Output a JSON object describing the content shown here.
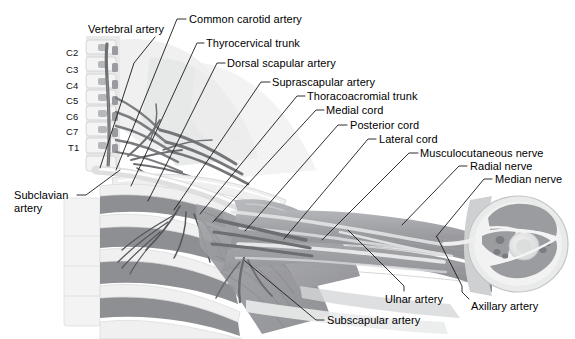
{
  "figure": {
    "background_color": "#ffffff",
    "line_color": "#1a1a1a",
    "text_color": "#000000"
  },
  "vertebrae": [
    {
      "id": "c2",
      "label": "C2",
      "x": 66,
      "y": 53
    },
    {
      "id": "c3",
      "label": "C3",
      "x": 66,
      "y": 70
    },
    {
      "id": "c4",
      "label": "C4",
      "x": 66,
      "y": 86
    },
    {
      "id": "c5",
      "label": "C5",
      "x": 66,
      "y": 101
    },
    {
      "id": "c6",
      "label": "C6",
      "x": 66,
      "y": 117
    },
    {
      "id": "c7",
      "label": "C7",
      "x": 66,
      "y": 132
    },
    {
      "id": "t1",
      "label": "T1",
      "x": 68,
      "y": 148
    }
  ],
  "labels": [
    {
      "id": "vertebral-artery",
      "text": "Vertebral artery",
      "x": 88,
      "y": 23,
      "anchor": "start",
      "leader": "M 155,37 L 134,63 L 100,168"
    },
    {
      "id": "common-carotid-artery",
      "text": "Common carotid artery",
      "x": 189,
      "y": 13,
      "anchor": "start",
      "leader": "M 186,19 L 177,19 L 116,170"
    },
    {
      "id": "thyrocervical-trunk",
      "text": "Thyrocervical trunk",
      "x": 206,
      "y": 37,
      "anchor": "start",
      "leader": "M 204,43 L 197,43 L 131,186"
    },
    {
      "id": "dorsal-scapular-artery",
      "text": "Dorsal scapular artery",
      "x": 227,
      "y": 57,
      "anchor": "start",
      "leader": "M 225,63 L 217,63 L 148,201"
    },
    {
      "id": "suprascapular-artery",
      "text": "Suprascapular artery",
      "x": 272,
      "y": 76,
      "anchor": "start",
      "leader": "M 270,82 L 261,82 L 174,210"
    },
    {
      "id": "thoracoacromial-trunk",
      "text": "Thoracoacromial trunk",
      "x": 307,
      "y": 90,
      "anchor": "start",
      "leader": "M 305,96 L 297,96 L 200,214"
    },
    {
      "id": "medial-cord",
      "text": "Medial cord",
      "x": 326,
      "y": 104,
      "anchor": "start",
      "leader": "M 324,110 L 316,110 L 213,222"
    },
    {
      "id": "posterior-cord",
      "text": "Posterior cord",
      "x": 350,
      "y": 119,
      "anchor": "start",
      "leader": "M 347,125 L 338,125 L 245,231"
    },
    {
      "id": "lateral-cord",
      "text": "Lateral cord",
      "x": 379,
      "y": 133,
      "anchor": "start",
      "leader": "M 376,139 L 368,139 L 284,239"
    },
    {
      "id": "musculocutaneous-nerve",
      "text": "Musculocutaneous nerve",
      "x": 420,
      "y": 147,
      "anchor": "start",
      "leader": "M 418,153 L 409,153 L 322,240"
    },
    {
      "id": "radial-nerve",
      "text": "Radial nerve",
      "x": 470,
      "y": 160,
      "anchor": "start",
      "leader": "M 467,166 L 459,166 L 402,225"
    },
    {
      "id": "median-nerve",
      "text": "Median nerve",
      "x": 495,
      "y": 173,
      "anchor": "start",
      "leader": "M 492,179 L 484,179 L 436,237"
    },
    {
      "id": "subclavian-artery",
      "text": "Subclavian artery",
      "x": 14,
      "y": 189,
      "anchor": "start",
      "two_line": true,
      "leader": "M 77,195 L 86,195 L 120,170"
    },
    {
      "id": "subscapular-artery",
      "text": "Subscapular artery",
      "x": 327,
      "y": 314,
      "anchor": "start",
      "leader": "M 324,320 L 316,320 L 245,261"
    },
    {
      "id": "ulnar-artery",
      "text": "Ulnar artery",
      "x": 385,
      "y": 293,
      "anchor": "start",
      "leader": "M 404,291 L 404,286 L 348,230"
    },
    {
      "id": "axillary-artery",
      "text": "Axillary artery",
      "x": 471,
      "y": 300,
      "anchor": "start",
      "leader": "M 469,299 L 462,292 L 462,286 L 437,237"
    }
  ],
  "structures": {
    "cervical_spine": "cervical vertebrae C2-T1 with vertebral artery",
    "ribs": "anterior rib cage with intercostal muscles",
    "sternum": "sternum",
    "clavicle": "clavicle",
    "shoulder": "deltoid and pectoral musculature",
    "arm": "upper arm with neurovascular bundle",
    "cross_section": "transverse cross-section of arm showing humerus, muscle compartments and vessels"
  },
  "palette": {
    "muscle_dark": "#8f9094",
    "muscle_mid": "#a9aaae",
    "muscle_light": "#c2c3c6",
    "bone_light": "#eceded",
    "bone_mid": "#dadbdc",
    "vessel_dark": "#6e6f73",
    "vessel_light": "#e4e5e6",
    "skin_pale": "#e9eaea",
    "background": "#ffffff"
  }
}
